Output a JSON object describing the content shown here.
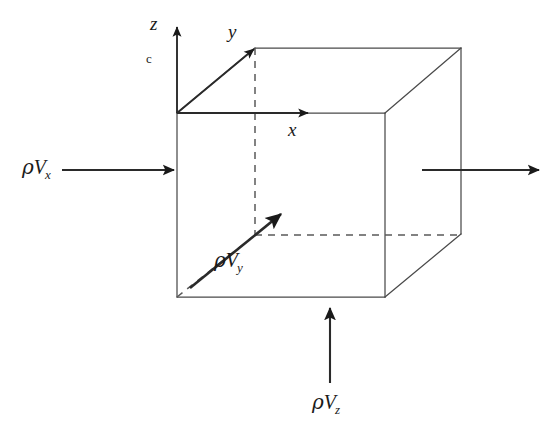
{
  "figure": {
    "type": "diagram",
    "background_color": "#ffffff",
    "line_color": "#3a3a3a",
    "dashed_color": "#555555",
    "arrow_color": "#1a1a1a"
  },
  "axes": {
    "z": {
      "label": "z",
      "direction": "up"
    },
    "y": {
      "label": "y",
      "direction": "up-right-diagonal"
    },
    "x": {
      "label": "x",
      "direction": "right"
    },
    "origin_mark": "c"
  },
  "flux_labels": {
    "x": {
      "rho": "ρ",
      "v": "V",
      "sub": "x",
      "text": "ρVₓ"
    },
    "y": {
      "rho": "ρ",
      "v": "V",
      "sub": "y",
      "text": "ρVᵧ"
    },
    "z": {
      "rho": "ρ",
      "v": "V",
      "sub": "z",
      "text": "ρV_z"
    }
  },
  "arrows": [
    {
      "name": "inflow-x",
      "from": [
        60,
        170
      ],
      "to": [
        177,
        170
      ],
      "label": "ρVx"
    },
    {
      "name": "outflow-x",
      "from": [
        422,
        170
      ],
      "to": [
        540,
        170
      ],
      "label": ""
    },
    {
      "name": "inflow-z",
      "from": [
        330,
        383
      ],
      "to": [
        330,
        306
      ],
      "label": "ρVz"
    },
    {
      "name": "inflow-y",
      "from": [
        190,
        288
      ],
      "to": [
        283,
        212
      ],
      "label": "ρVy"
    },
    {
      "name": "axis-z",
      "from": [
        177,
        113
      ],
      "to": [
        177,
        25
      ],
      "label": "z"
    },
    {
      "name": "axis-y",
      "from": [
        177,
        113
      ],
      "to": [
        256,
        47
      ],
      "label": "y"
    },
    {
      "name": "axis-x",
      "from": [
        177,
        113
      ],
      "to": [
        310,
        113
      ],
      "label": "x"
    }
  ],
  "cube": {
    "front_face": [
      [
        177,
        113
      ],
      [
        385,
        113
      ],
      [
        385,
        297
      ],
      [
        177,
        297
      ]
    ],
    "back_offset": [
      76,
      -65
    ],
    "hidden_edges": [
      [
        [
          255,
          48
        ],
        [
          255,
          235
        ]
      ],
      [
        [
          255,
          235
        ],
        [
          461,
          235
        ]
      ],
      [
        [
          177,
          297
        ],
        [
          255,
          235
        ]
      ]
    ]
  }
}
